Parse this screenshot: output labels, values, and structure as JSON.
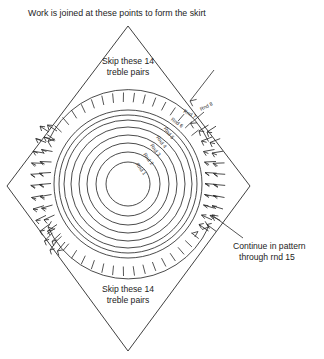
{
  "diagram": {
    "title": "Work is joined at these points to form the skirt",
    "type": "crochet-pattern-schematic",
    "shape": "diamond",
    "background_color": "#ffffff",
    "line_color": "#2a2a2a",
    "text_color": "#232323",
    "labels": {
      "top_note": "Skip these 14\ntreble pairs",
      "top_note_line1": "Skip these 14",
      "top_note_line2": "treble pairs",
      "bottom_note_line1": "Skip these 14",
      "bottom_note_line2": "treble pairs",
      "side_note_line1": "Continue in pattern",
      "side_note_line2": "through rnd 15"
    },
    "rounds": [
      {
        "id": 1,
        "label": "Rnd 1",
        "radius": 22
      },
      {
        "id": 2,
        "label": "Rnd 2",
        "radius": 32
      },
      {
        "id": 3,
        "label": "Rnd 3",
        "radius": 41
      },
      {
        "id": 4,
        "label": "Rnd 4",
        "radius": 49
      },
      {
        "id": 5,
        "label": "Rnd 5",
        "radius": 57
      },
      {
        "id": 6,
        "label": "Rnd 6",
        "radius": 64
      },
      {
        "id": 7,
        "label": "Rnd 7",
        "radius": 69
      },
      {
        "id": 8,
        "label": "Rnd 8",
        "radius": 74
      }
    ],
    "center": {
      "x": 128,
      "y": 184
    },
    "skipped_treble_pairs": 14,
    "continue_through_round": 15,
    "diamond_vertices": {
      "top": {
        "x": 128,
        "y": 26
      },
      "right": {
        "x": 250,
        "y": 186
      },
      "bottom": {
        "x": 128,
        "y": 351
      },
      "left": {
        "x": 7,
        "y": 186
      }
    }
  }
}
